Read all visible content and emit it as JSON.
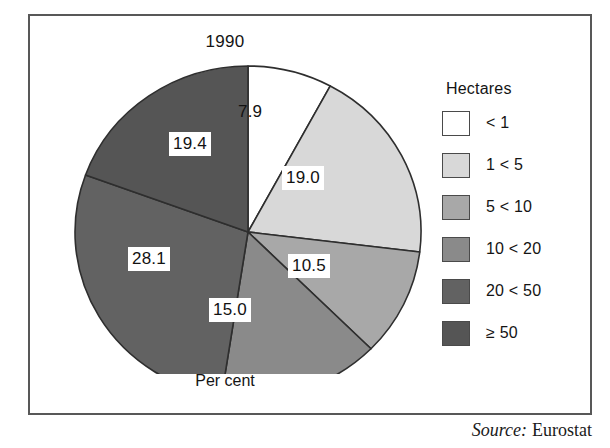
{
  "figure": {
    "title": "1990",
    "unit_caption": "Per cent",
    "source_label": "Source:",
    "source_value": "Eurostat"
  },
  "legend": {
    "title": "Hectares",
    "items": [
      {
        "label": "< 1",
        "color": "#ffffff"
      },
      {
        "label": "1 < 5",
        "color": "#d8d8d8"
      },
      {
        "label": "5 < 10",
        "color": "#a8a8a8"
      },
      {
        "label": "10 < 20",
        "color": "#8a8a8a"
      },
      {
        "label": "20 < 50",
        "color": "#626262"
      },
      {
        "label": "≥ 50",
        "color": "#555555"
      }
    ]
  },
  "chart_data": {
    "type": "pie",
    "title": "1990",
    "xlabel": "",
    "ylabel": "Per cent",
    "units": "Per cent",
    "legend_title": "Hectares",
    "legend_position": "right",
    "grid": false,
    "start_angle_deg": 0,
    "direction": "clockwise",
    "categories": [
      "< 1",
      "1 < 5",
      "5 < 10",
      "10 < 20",
      "20 < 50",
      "≥ 50"
    ],
    "values": [
      7.9,
      19.0,
      10.5,
      15.0,
      28.1,
      19.4
    ],
    "labels": [
      "7.9",
      "19.0",
      "10.5",
      "15.0",
      "28.1",
      "19.4"
    ],
    "colors": [
      "#ffffff",
      "#d8d8d8",
      "#a8a8a8",
      "#8a8a8a",
      "#626262",
      "#555555"
    ],
    "total": 99.9,
    "slices": [
      {
        "category": "< 1",
        "value": 7.9,
        "label": "7.9",
        "color": "#ffffff",
        "start_deg": 0.0,
        "end_deg": 28.4
      },
      {
        "category": "1 < 5",
        "value": 19.0,
        "label": "19.0",
        "color": "#d8d8d8",
        "start_deg": 28.4,
        "end_deg": 96.9
      },
      {
        "category": "5 < 10",
        "value": 10.5,
        "label": "10.5",
        "color": "#a8a8a8",
        "start_deg": 96.9,
        "end_deg": 134.7
      },
      {
        "category": "10 < 20",
        "value": 15.0,
        "label": "15.0",
        "color": "#8a8a8a",
        "start_deg": 134.7,
        "end_deg": 188.8
      },
      {
        "category": "20 < 50",
        "value": 28.1,
        "label": "28.1",
        "color": "#626262",
        "start_deg": 188.8,
        "end_deg": 290.1
      },
      {
        "category": "≥ 50",
        "value": 19.4,
        "label": "19.4",
        "color": "#555555",
        "start_deg": 290.1,
        "end_deg": 360.0
      }
    ]
  }
}
